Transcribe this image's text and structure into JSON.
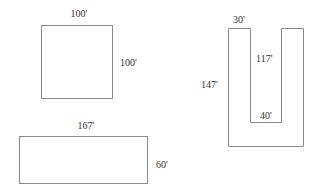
{
  "diagram": {
    "square": {
      "top_label": "100'",
      "side_label": "100'"
    },
    "rectangle": {
      "top_label": "167'",
      "side_label": "60'"
    },
    "u_shape": {
      "arm_width_label": "30'",
      "inner_height_label": "117'",
      "outer_height_label": "147'",
      "inner_width_label": "40'"
    },
    "colors": {
      "stroke": "#8a8a8a",
      "text": "#333333",
      "background": "#ffffff"
    }
  }
}
